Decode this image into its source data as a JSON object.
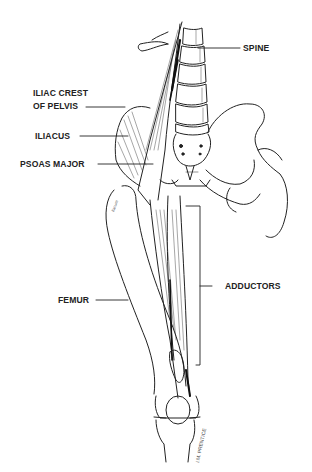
{
  "figure": {
    "type": "anatomical line illustration",
    "labels": [
      {
        "id": "spine",
        "text": "SPINE",
        "side": "right"
      },
      {
        "id": "iliac_crest",
        "text": "ILIAC CREST\nOF PELVIS",
        "line1": "ILIAC CREST",
        "line2": "OF PELVIS",
        "side": "left"
      },
      {
        "id": "iliacus",
        "text": "ILIACUS",
        "side": "left"
      },
      {
        "id": "psoas_major",
        "text": "PSOAS MAJOR",
        "side": "left"
      },
      {
        "id": "adductors",
        "text": "ADDUCTORS",
        "side": "right"
      },
      {
        "id": "femur",
        "text": "FEMUR",
        "side": "left"
      }
    ],
    "signature": "I.M. PRENTICE"
  },
  "colors": {
    "ink": "#222222",
    "background": "#ffffff"
  }
}
